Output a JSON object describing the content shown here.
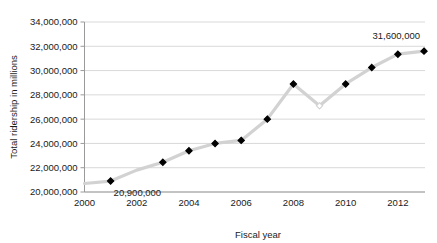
{
  "chart_data": {
    "type": "line",
    "title": "",
    "xlabel": "Fiscal year",
    "ylabel": "Total ridership in millions",
    "x": [
      2000,
      2001,
      2002,
      2003,
      2004,
      2005,
      2006,
      2007,
      2008,
      2009,
      2010,
      2011,
      2012,
      2013
    ],
    "values": [
      20700000,
      20900000,
      21800000,
      22450000,
      23400000,
      24000000,
      24250000,
      26000000,
      28900000,
      27100000,
      28900000,
      30250000,
      31350000,
      31600000
    ],
    "series": [
      {
        "name": "Total ridership",
        "values": [
          20700000,
          20900000,
          21800000,
          22450000,
          23400000,
          24000000,
          24250000,
          26000000,
          28900000,
          27100000,
          28900000,
          30250000,
          31350000,
          31600000
        ]
      }
    ],
    "markers": [
      {
        "x": 2000,
        "y": 20700000,
        "filled": false,
        "shown": false
      },
      {
        "x": 2001,
        "y": 20900000,
        "filled": true,
        "shown": true
      },
      {
        "x": 2002,
        "y": 21800000,
        "filled": false,
        "shown": false
      },
      {
        "x": 2003,
        "y": 22450000,
        "filled": true,
        "shown": true
      },
      {
        "x": 2004,
        "y": 23400000,
        "filled": true,
        "shown": true
      },
      {
        "x": 2005,
        "y": 24000000,
        "filled": true,
        "shown": true
      },
      {
        "x": 2006,
        "y": 24250000,
        "filled": true,
        "shown": true
      },
      {
        "x": 2007,
        "y": 26000000,
        "filled": true,
        "shown": true
      },
      {
        "x": 2008,
        "y": 28900000,
        "filled": true,
        "shown": true
      },
      {
        "x": 2009,
        "y": 27100000,
        "filled": false,
        "shown": true
      },
      {
        "x": 2010,
        "y": 28900000,
        "filled": true,
        "shown": true
      },
      {
        "x": 2011,
        "y": 30250000,
        "filled": true,
        "shown": true
      },
      {
        "x": 2012,
        "y": 31350000,
        "filled": true,
        "shown": true
      },
      {
        "x": 2013,
        "y": 31600000,
        "filled": true,
        "shown": true
      }
    ],
    "ytick_labels": [
      "20,000,000",
      "22,000,000",
      "24,000,000",
      "26,000,000",
      "28,000,000",
      "30,000,000",
      "32,000,000",
      "34,000,000"
    ],
    "ytick_values": [
      20000000,
      22000000,
      24000000,
      26000000,
      28000000,
      30000000,
      32000000,
      34000000
    ],
    "xtick_labels": [
      "2000",
      "2002",
      "2004",
      "2006",
      "2008",
      "2010",
      "2012"
    ],
    "xtick_values": [
      2000,
      2002,
      2004,
      2006,
      2008,
      2010,
      2012
    ],
    "ylim": [
      20000000,
      34000000
    ],
    "xlim": [
      2000,
      2013
    ],
    "grid": true,
    "legend": "none",
    "annotations": [
      {
        "name": "first-point-label",
        "text": "20,900,000",
        "x": 2001,
        "y": 20900000
      },
      {
        "name": "last-point-label",
        "text": "31,600,000",
        "x": 2013,
        "y": 31600000
      }
    ],
    "colors": {
      "line": "#d2d2d2",
      "marker": "#000000",
      "grid": "#d9d9d9",
      "axis": "#9a9a9a",
      "text": "#1a1a1a",
      "background": "#ffffff"
    }
  }
}
